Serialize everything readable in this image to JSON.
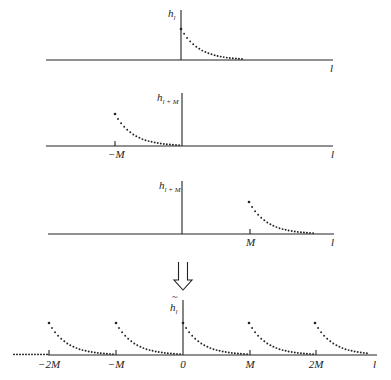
{
  "diagram": {
    "panels": [
      {
        "id": "original",
        "y_label": "h",
        "y_label_sub": "l",
        "x_label": "l",
        "ticks": [],
        "axis_y": 60,
        "origin_x": 181,
        "curve_start_x": 181,
        "vert_top": 10
      },
      {
        "id": "shift-left",
        "y_label": "h",
        "y_label_sub": "l + M",
        "x_label": "l",
        "ticks": [
          {
            "x": 115,
            "label": "−M"
          }
        ],
        "axis_y": 146,
        "origin_x": 182,
        "curve_start_x": 115,
        "vert_top": 93
      },
      {
        "id": "shift-right",
        "y_label": "h",
        "y_label_sub": "l + M",
        "x_label": "l",
        "ticks": [
          {
            "x": 250,
            "label": "M"
          }
        ],
        "axis_y": 234,
        "origin_x": 182,
        "curve_start_x": 249,
        "vert_top": 181
      }
    ],
    "arrow": {
      "symbol": "double-down-arrow"
    },
    "result": {
      "y_label": "h̃",
      "y_label_base": "h",
      "y_label_tilde": "~",
      "y_label_sub": "l",
      "x_label": "l",
      "ticks": [
        {
          "x": 49,
          "label": "−2M"
        },
        {
          "x": 116,
          "label": "−M"
        },
        {
          "x": 183,
          "label": "0"
        },
        {
          "x": 250,
          "label": "M"
        },
        {
          "x": 316,
          "label": "2M"
        }
      ],
      "axis_y": 355,
      "curve_starts": [
        49,
        116,
        183,
        249,
        315
      ],
      "vert_top": 300
    }
  },
  "labels": {
    "p1_h": "h",
    "p1_sub": "l",
    "p1_x": "l",
    "p2_h": "h",
    "p2_sub": "l + M",
    "p2_x": "l",
    "p2_tick": "−M",
    "p3_h": "h",
    "p3_sub": "l + M",
    "p3_x": "l",
    "p3_tick": "M",
    "r_h": "h",
    "r_tilde": "~",
    "r_sub": "l",
    "r_x": "l",
    "r_ticks": [
      "−2M",
      "−M",
      "0",
      "M",
      "2M"
    ]
  }
}
